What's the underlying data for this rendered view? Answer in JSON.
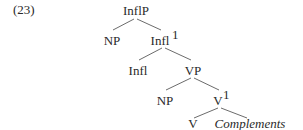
{
  "example": {
    "number": "(23)"
  },
  "tree": {
    "nodes": {
      "inflp": {
        "label": "InflP",
        "sup": ""
      },
      "np_subject": {
        "label": "NP",
        "sup": ""
      },
      "infl_bar": {
        "label": "Infl",
        "sup": "1"
      },
      "infl": {
        "label": "Infl",
        "sup": ""
      },
      "vp": {
        "label": "VP",
        "sup": ""
      },
      "np_object": {
        "label": "NP",
        "sup": ""
      },
      "v_bar": {
        "label": "V",
        "sup": "1"
      },
      "v": {
        "label": "V",
        "sup": ""
      },
      "complements": {
        "label": "Complements",
        "sup": "",
        "style": "italic"
      }
    },
    "edges": [
      [
        "InflP",
        "NP"
      ],
      [
        "InflP",
        "Infl1"
      ],
      [
        "Infl1",
        "Infl"
      ],
      [
        "Infl1",
        "VP"
      ],
      [
        "VP",
        "NP"
      ],
      [
        "VP",
        "V1"
      ],
      [
        "V1",
        "V"
      ],
      [
        "V1",
        "Complements"
      ]
    ]
  }
}
